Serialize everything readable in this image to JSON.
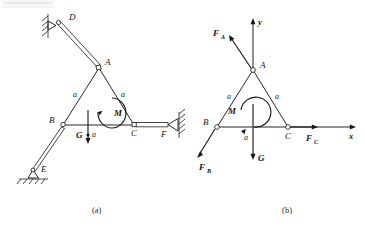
{
  "figure": {
    "caption_a": "(a)",
    "caption_b": "(b)",
    "diagram_a": {
      "name": "structure-mechanism-diagram",
      "points": [
        {
          "id": "D",
          "label": "D"
        },
        {
          "id": "A",
          "label": "A"
        },
        {
          "id": "B",
          "label": "B"
        },
        {
          "id": "C",
          "label": "C"
        },
        {
          "id": "E",
          "label": "E"
        },
        {
          "id": "F",
          "label": "F"
        },
        {
          "id": "G",
          "label": "G"
        }
      ],
      "dimensions": [
        {
          "id": "a-left",
          "label": "a"
        },
        {
          "id": "a-right",
          "label": "a"
        },
        {
          "id": "a-bottom",
          "label": "a"
        }
      ],
      "moment_label": "M",
      "weight_label": "G",
      "supports": [
        {
          "id": "D",
          "type": "pin-on-wall"
        },
        {
          "id": "E",
          "type": "pin-on-ground"
        },
        {
          "id": "F",
          "type": "pin-on-wall"
        }
      ]
    },
    "diagram_b": {
      "name": "free-body-diagram",
      "points": [
        {
          "id": "A",
          "label": "A"
        },
        {
          "id": "B",
          "label": "B"
        },
        {
          "id": "C",
          "label": "C"
        }
      ],
      "dimensions": [
        {
          "id": "a-left",
          "label": "a"
        },
        {
          "id": "a-right",
          "label": "a"
        },
        {
          "id": "a-bottom",
          "label": "a"
        }
      ],
      "forces": [
        {
          "id": "FA",
          "base": "F",
          "sub": "A"
        },
        {
          "id": "FB",
          "base": "F",
          "sub": "B"
        },
        {
          "id": "FC",
          "base": "F",
          "sub": "C"
        },
        {
          "id": "G",
          "base": "G",
          "sub": ""
        }
      ],
      "moment_label": "M",
      "axes": [
        {
          "id": "x",
          "label": "x"
        },
        {
          "id": "y",
          "label": "y"
        }
      ]
    },
    "colors": {
      "ink": "#1a1a1a",
      "paper": "#ffffff"
    }
  }
}
